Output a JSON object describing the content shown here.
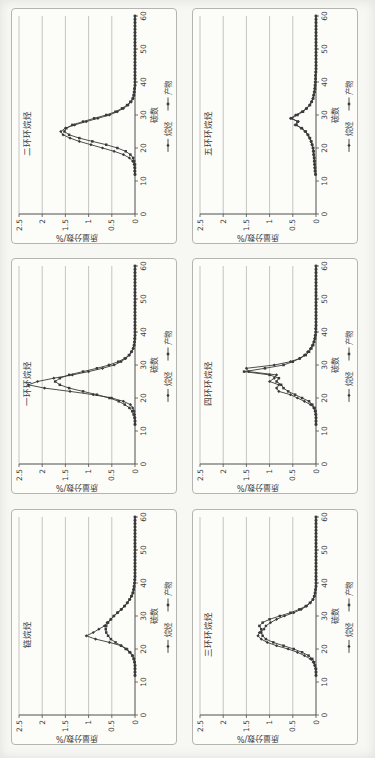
{
  "colors": {
    "line": "#3a3a3a",
    "grid": "#9d9d9d",
    "axis": "#4e4e4e",
    "text": "#3d3d3d",
    "frame": "#b4b4b0",
    "panel_background": "#fcfcf9",
    "page_background": "#f7f7f4"
  },
  "chart_data": {
    "type": "line",
    "orientation": "page-rotated-90-ccw",
    "xlabel": "碳数",
    "ylabel": "质量分数/%",
    "xlim": [
      0,
      60
    ],
    "ylim": [
      0,
      2.5
    ],
    "xticks": [
      0,
      10,
      20,
      30,
      40,
      50,
      60
    ],
    "yticks": [
      0,
      0.5,
      1,
      1.5,
      2,
      2.5
    ],
    "grid": "horizontal",
    "legend_position": "bottom",
    "legend": [
      "烷烃",
      "产物"
    ],
    "markers": [
      "diamond",
      "square"
    ],
    "x": [
      10,
      11,
      12,
      13,
      14,
      15,
      16,
      17,
      18,
      19,
      20,
      21,
      22,
      23,
      24,
      25,
      26,
      27,
      28,
      29,
      30,
      31,
      32,
      33,
      34,
      35,
      36,
      37,
      38,
      39,
      40,
      41,
      42,
      43,
      44,
      45,
      46,
      47,
      48,
      49,
      50,
      51,
      52,
      53,
      54,
      55,
      56,
      57,
      58,
      59,
      60
    ],
    "panels": [
      {
        "title": "二环环烷烃",
        "series": [
          {
            "name": "烷烃",
            "marker": "diamond",
            "values": [
              0,
              0,
              0,
              0.01,
              0.01,
              0.02,
              0.05,
              0.12,
              0.25,
              0.45,
              0.7,
              0.95,
              1.2,
              1.4,
              1.55,
              1.6,
              1.5,
              1.3,
              1.05,
              0.8,
              0.55,
              0.38,
              0.25,
              0.15,
              0.08,
              0.04,
              0.02,
              0.01,
              0.01,
              0,
              0,
              0,
              0,
              0,
              0,
              0,
              0,
              0,
              0,
              0,
              0,
              0,
              0,
              0,
              0,
              0,
              0,
              0,
              0,
              0,
              0
            ]
          },
          {
            "name": "产物",
            "marker": "square",
            "values": [
              0,
              0,
              0,
              0,
              0,
              0,
              0.02,
              0.04,
              0.1,
              0.2,
              0.38,
              0.62,
              0.92,
              1.2,
              1.42,
              1.52,
              1.48,
              1.35,
              1.12,
              0.88,
              0.62,
              0.42,
              0.28,
              0.17,
              0.1,
              0.05,
              0.03,
              0.02,
              0.01,
              0,
              0,
              0,
              0,
              0,
              0,
              0,
              0,
              0,
              0,
              0,
              0,
              0,
              0,
              0,
              0,
              0,
              0,
              0,
              0,
              0,
              0
            ]
          }
        ]
      },
      {
        "title": "五环环烷烃",
        "series": [
          {
            "name": "烷烃",
            "marker": "diamond",
            "values": [
              0,
              0,
              0.01,
              0.02,
              0.03,
              0.03,
              0.04,
              0.04,
              0.05,
              0.06,
              0.07,
              0.09,
              0.11,
              0.14,
              0.18,
              0.24,
              0.3,
              0.45,
              0.38,
              0.55,
              0.44,
              0.3,
              0.21,
              0.14,
              0.1,
              0.07,
              0.05,
              0.04,
              0.03,
              0.02,
              0.02,
              0.01,
              0.01,
              0.01,
              0,
              0,
              0,
              0,
              0,
              0,
              0,
              0,
              0,
              0,
              0,
              0,
              0,
              0,
              0,
              0,
              0
            ]
          },
          {
            "name": "产物",
            "marker": "square",
            "values": [
              0,
              0,
              0.01,
              0.02,
              0.02,
              0.03,
              0.03,
              0.04,
              0.05,
              0.05,
              0.06,
              0.08,
              0.1,
              0.13,
              0.17,
              0.22,
              0.32,
              0.42,
              0.4,
              0.52,
              0.4,
              0.28,
              0.2,
              0.13,
              0.09,
              0.06,
              0.05,
              0.03,
              0.02,
              0.02,
              0.01,
              0.01,
              0.01,
              0,
              0,
              0,
              0,
              0,
              0,
              0,
              0,
              0,
              0,
              0,
              0,
              0,
              0,
              0,
              0,
              0,
              0
            ]
          }
        ]
      },
      {
        "title": "一环环烷烃",
        "series": [
          {
            "name": "烷烃",
            "marker": "diamond",
            "values": [
              0,
              0,
              0,
              0,
              0,
              0.01,
              0.02,
              0.05,
              0.1,
              0.25,
              0.5,
              0.9,
              1.4,
              1.95,
              2.3,
              2.1,
              1.75,
              1.35,
              1.0,
              0.7,
              0.45,
              0.3,
              0.2,
              0.12,
              0.07,
              0.04,
              0.02,
              0.01,
              0.01,
              0,
              0,
              0,
              0,
              0,
              0,
              0,
              0,
              0,
              0,
              0,
              0,
              0,
              0,
              0,
              0,
              0,
              0,
              0,
              0,
              0,
              0
            ]
          },
          {
            "name": "产物",
            "marker": "square",
            "values": [
              0,
              0,
              0,
              0,
              0.01,
              0.03,
              0.06,
              0.12,
              0.22,
              0.35,
              0.55,
              0.82,
              1.12,
              1.42,
              1.62,
              1.72,
              1.62,
              1.42,
              1.12,
              0.82,
              0.56,
              0.36,
              0.22,
              0.13,
              0.08,
              0.04,
              0.02,
              0.01,
              0,
              0,
              0,
              0,
              0,
              0,
              0,
              0,
              0,
              0,
              0,
              0,
              0,
              0,
              0,
              0,
              0,
              0,
              0,
              0,
              0,
              0,
              0
            ]
          }
        ]
      },
      {
        "title": "四环环烷烃",
        "series": [
          {
            "name": "烷烃",
            "marker": "diamond",
            "values": [
              0,
              0,
              0,
              0,
              0,
              0.01,
              0.02,
              0.05,
              0.12,
              0.25,
              0.4,
              0.55,
              0.8,
              0.85,
              0.8,
              1.0,
              0.9,
              0.85,
              1.45,
              1.5,
              0.9,
              0.55,
              0.35,
              0.25,
              0.18,
              0.12,
              0.08,
              0.05,
              0.03,
              0.02,
              0.01,
              0.01,
              0,
              0,
              0,
              0,
              0,
              0,
              0,
              0,
              0,
              0,
              0,
              0,
              0,
              0,
              0,
              0,
              0,
              0,
              0
            ]
          },
          {
            "name": "产物",
            "marker": "square",
            "values": [
              0,
              0,
              0,
              0,
              0,
              0,
              0.01,
              0.03,
              0.08,
              0.15,
              0.3,
              0.45,
              0.6,
              0.7,
              0.75,
              0.85,
              0.8,
              1.0,
              1.55,
              1.1,
              0.7,
              0.5,
              0.35,
              0.22,
              0.15,
              0.1,
              0.06,
              0.04,
              0.02,
              0.01,
              0,
              0,
              0,
              0,
              0,
              0,
              0,
              0,
              0,
              0,
              0,
              0,
              0,
              0,
              0,
              0,
              0,
              0,
              0,
              0,
              0
            ]
          }
        ]
      },
      {
        "title": "链烷烃",
        "series": [
          {
            "name": "烷烃",
            "marker": "diamond",
            "values": [
              0,
              0,
              0,
              0,
              0,
              0,
              0.01,
              0.02,
              0.05,
              0.1,
              0.17,
              0.3,
              0.55,
              0.85,
              1.05,
              0.9,
              0.78,
              0.66,
              0.6,
              0.52,
              0.45,
              0.37,
              0.29,
              0.22,
              0.16,
              0.11,
              0.07,
              0.04,
              0.03,
              0.02,
              0.01,
              0.01,
              0,
              0,
              0,
              0,
              0,
              0,
              0,
              0,
              0,
              0,
              0,
              0,
              0,
              0,
              0,
              0,
              0,
              0,
              0
            ]
          },
          {
            "name": "产物",
            "marker": "square",
            "values": [
              0,
              0,
              0,
              0,
              0,
              0,
              0.01,
              0.03,
              0.06,
              0.12,
              0.2,
              0.3,
              0.42,
              0.52,
              0.58,
              0.62,
              0.63,
              0.62,
              0.58,
              0.52,
              0.46,
              0.38,
              0.3,
              0.23,
              0.17,
              0.12,
              0.08,
              0.05,
              0.03,
              0.02,
              0.01,
              0,
              0,
              0,
              0,
              0,
              0,
              0,
              0,
              0,
              0,
              0,
              0,
              0,
              0,
              0,
              0,
              0,
              0,
              0,
              0
            ]
          }
        ]
      },
      {
        "title": "三环环烷烃",
        "series": [
          {
            "name": "烷烃",
            "marker": "diamond",
            "values": [
              0,
              0,
              0,
              0,
              0.01,
              0.03,
              0.06,
              0.12,
              0.25,
              0.4,
              0.6,
              0.85,
              1.05,
              1.18,
              1.25,
              1.22,
              1.12,
              1.08,
              0.98,
              0.85,
              0.68,
              0.48,
              0.32,
              0.2,
              0.12,
              0.06,
              0.03,
              0.02,
              0.01,
              0,
              0,
              0,
              0,
              0,
              0,
              0,
              0,
              0,
              0,
              0,
              0,
              0,
              0,
              0,
              0,
              0,
              0,
              0,
              0,
              0,
              0
            ]
          },
          {
            "name": "产物",
            "marker": "square",
            "values": [
              0,
              0,
              0,
              0,
              0,
              0.02,
              0.04,
              0.08,
              0.16,
              0.3,
              0.48,
              0.7,
              0.92,
              1.08,
              1.15,
              1.18,
              1.18,
              1.22,
              1.15,
              1.0,
              0.78,
              0.55,
              0.36,
              0.22,
              0.13,
              0.07,
              0.04,
              0.02,
              0.01,
              0,
              0,
              0,
              0,
              0,
              0,
              0,
              0,
              0,
              0,
              0,
              0,
              0,
              0,
              0,
              0,
              0,
              0,
              0,
              0,
              0,
              0
            ]
          }
        ]
      }
    ]
  }
}
